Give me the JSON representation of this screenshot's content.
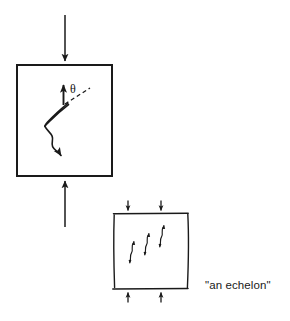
{
  "figure": {
    "background_color": "#ffffff",
    "stroke_color": "#1a1a1a",
    "text_color": "#1a1a1a"
  },
  "labels": {
    "theta": "θ",
    "echelon_caption": "\"an echelon\""
  },
  "specimen_main": {
    "name": "main-specimen-box",
    "x": 17,
    "y": 65,
    "width": 95,
    "height": 111,
    "stroke_width": 2
  },
  "specimen_echelon": {
    "name": "echelon-specimen-box",
    "x": 113,
    "y": 214,
    "width": 75,
    "height": 74,
    "stroke_width": 1.4
  },
  "load_arrows_main": [
    {
      "name": "top-load-arrow",
      "direction": "down",
      "x": 65,
      "y_start": 15,
      "y_end": 62
    },
    {
      "name": "bottom-load-arrow",
      "direction": "up",
      "x": 65,
      "y_start": 226,
      "y_end": 180
    }
  ],
  "load_arrows_echelon": [
    {
      "name": "echelon-top-load-arrow-left",
      "direction": "down",
      "x": 128,
      "y_start": 201,
      "y_end": 212
    },
    {
      "name": "echelon-top-load-arrow-right",
      "direction": "down",
      "x": 161,
      "y_start": 201,
      "y_end": 212
    },
    {
      "name": "echelon-bottom-load-arrow-left",
      "direction": "up",
      "x": 128,
      "y_start": 302,
      "y_end": 291
    },
    {
      "name": "echelon-bottom-load-arrow-right",
      "direction": "up",
      "x": 161,
      "y_start": 302,
      "y_end": 291
    }
  ],
  "crack_main": {
    "name": "wing-crack-sliver",
    "description": "elongated lens-shaped crack with wavy tail and downward arrowhead",
    "arrow_head_direction": "down"
  },
  "crack_main_normal_arrow": {
    "name": "crack-normal-arrow",
    "direction": "up",
    "x": 63,
    "y_start": 104,
    "y_end": 84
  },
  "dashed_reference_line": {
    "name": "dashed-reference-line",
    "x1": 64,
    "y1": 104,
    "x2": 89,
    "y2": 88,
    "dash_pattern": "4 3"
  },
  "angle_annotation": {
    "name": "theta-angle-label",
    "symbol": "θ",
    "x": 72,
    "y": 92
  },
  "echelon_cracks": [
    {
      "name": "echelon-crack-1",
      "index": 1,
      "origin_x": 131,
      "origin_y": 250
    },
    {
      "name": "echelon-crack-2",
      "index": 2,
      "origin_x": 146,
      "origin_y": 242
    },
    {
      "name": "echelon-crack-3",
      "index": 3,
      "origin_x": 161,
      "origin_y": 234
    }
  ]
}
